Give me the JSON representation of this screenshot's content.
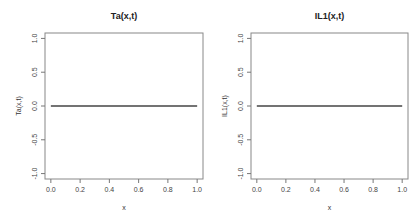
{
  "chart_data": [
    {
      "type": "line",
      "title": "Ta(x,t)",
      "xlabel": "x",
      "ylabel": "Ta(x,t)",
      "xlim": [
        -0.04,
        1.04
      ],
      "ylim": [
        -1.08,
        1.08
      ],
      "xticks": [
        0.0,
        0.2,
        0.4,
        0.6,
        0.8,
        1.0
      ],
      "xtick_labels": [
        "0.0",
        "0.2",
        "0.4",
        "0.6",
        "0.8",
        "1.0"
      ],
      "yticks": [
        -1.0,
        -0.5,
        0.0,
        0.5,
        1.0
      ],
      "ytick_labels": [
        "-1.0",
        "-0.5",
        "0.0",
        "0.5",
        "1.0"
      ],
      "grid": false,
      "series": [
        {
          "name": "Ta",
          "x": [
            0.0,
            0.25,
            0.5,
            0.75,
            1.0
          ],
          "y": [
            0,
            0,
            0,
            0,
            0
          ],
          "color": "#444444"
        }
      ]
    },
    {
      "type": "line",
      "title": "IL1(x,t)",
      "xlabel": "x",
      "ylabel": "IL1(x,t)",
      "xlim": [
        -0.04,
        1.04
      ],
      "ylim": [
        -1.08,
        1.08
      ],
      "xticks": [
        0.0,
        0.2,
        0.4,
        0.6,
        0.8,
        1.0
      ],
      "xtick_labels": [
        "0.0",
        "0.2",
        "0.4",
        "0.6",
        "0.8",
        "1.0"
      ],
      "yticks": [
        -1.0,
        -0.5,
        0.0,
        0.5,
        1.0
      ],
      "ytick_labels": [
        "-1.0",
        "-0.5",
        "0.0",
        "0.5",
        "1.0"
      ],
      "grid": false,
      "series": [
        {
          "name": "IL1",
          "x": [
            0.0,
            0.25,
            0.5,
            0.75,
            1.0
          ],
          "y": [
            0,
            0,
            0,
            0,
            0
          ],
          "color": "#444444"
        }
      ]
    }
  ]
}
